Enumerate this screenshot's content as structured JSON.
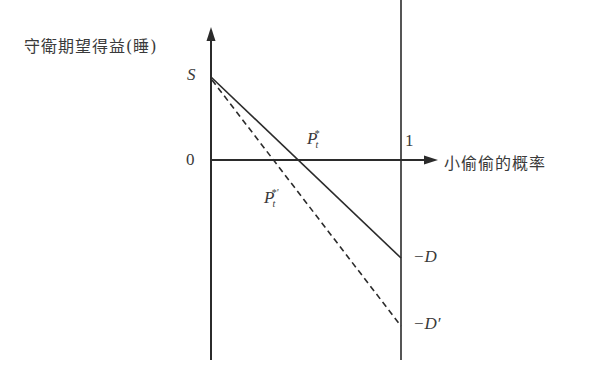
{
  "diagram": {
    "y_axis_label": "守衛期望得益(睡)",
    "x_axis_label": "小偷偷的概率",
    "labels": {
      "S": "S",
      "zero": "0",
      "one": "1",
      "P_star": "P",
      "P_star_sub": "t",
      "P_star_sup": "*",
      "P_star_prime": "P",
      "P_star_prime_sub": "t",
      "P_star_prime_sup": "*'",
      "minus_D": "−D",
      "minus_D_prime": "−D′"
    },
    "lines": [
      {
        "name": "solid-payoff-line",
        "style": "solid",
        "from": [
          0,
          "S"
        ],
        "to": [
          1,
          "-D"
        ]
      },
      {
        "name": "dashed-payoff-line",
        "style": "dashed",
        "from": [
          0,
          "S"
        ],
        "to": [
          1,
          "-D'"
        ]
      }
    ],
    "colors": {
      "line": "#2b2b2b",
      "text": "#3a3a3a",
      "background": "#ffffff"
    }
  }
}
